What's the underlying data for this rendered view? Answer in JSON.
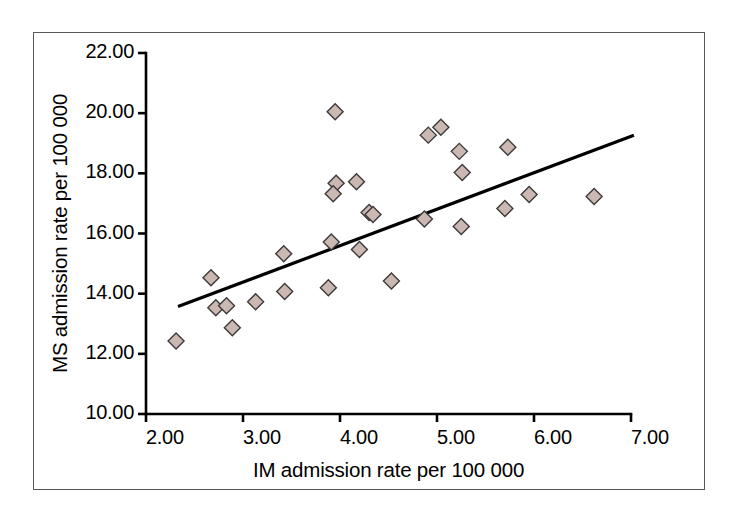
{
  "chart_data": {
    "type": "scatter",
    "title": "",
    "xlabel": "IM admission rate per 100 000",
    "ylabel": "MS admission rate per 100 000",
    "xlim": [
      2.0,
      7.0
    ],
    "ylim": [
      10.0,
      22.0
    ],
    "xticks": [
      "2.00",
      "3.00",
      "4.00",
      "5.00",
      "6.00",
      "7.00"
    ],
    "xtick_values": [
      2.0,
      3.0,
      4.0,
      5.0,
      6.0,
      7.0
    ],
    "yticks": [
      "10.00",
      "12.00",
      "14.00",
      "16.00",
      "18.00",
      "20.00",
      "22.00"
    ],
    "ytick_values": [
      10.0,
      12.0,
      14.0,
      16.0,
      18.0,
      20.0,
      22.0
    ],
    "grid": false,
    "legend": null,
    "marker": {
      "shape": "diamond",
      "fill": "#cbb8b2",
      "stroke": "#3c3a3a",
      "size": 16
    },
    "points": [
      {
        "x": 2.31,
        "y": 12.43
      },
      {
        "x": 2.72,
        "y": 13.53
      },
      {
        "x": 2.67,
        "y": 14.53
      },
      {
        "x": 2.83,
        "y": 13.6
      },
      {
        "x": 2.89,
        "y": 12.87
      },
      {
        "x": 3.13,
        "y": 13.73
      },
      {
        "x": 3.43,
        "y": 14.07
      },
      {
        "x": 3.42,
        "y": 15.33
      },
      {
        "x": 3.88,
        "y": 14.2
      },
      {
        "x": 3.91,
        "y": 15.72
      },
      {
        "x": 3.96,
        "y": 17.67
      },
      {
        "x": 3.93,
        "y": 17.32
      },
      {
        "x": 3.95,
        "y": 20.05
      },
      {
        "x": 4.17,
        "y": 17.72
      },
      {
        "x": 4.2,
        "y": 15.47
      },
      {
        "x": 4.3,
        "y": 16.7
      },
      {
        "x": 4.34,
        "y": 16.63
      },
      {
        "x": 4.53,
        "y": 14.42
      },
      {
        "x": 4.87,
        "y": 16.48
      },
      {
        "x": 4.91,
        "y": 19.27
      },
      {
        "x": 5.04,
        "y": 19.53
      },
      {
        "x": 5.23,
        "y": 18.73
      },
      {
        "x": 5.26,
        "y": 18.03
      },
      {
        "x": 5.25,
        "y": 16.23
      },
      {
        "x": 5.7,
        "y": 16.83
      },
      {
        "x": 5.73,
        "y": 18.87
      },
      {
        "x": 5.95,
        "y": 17.3
      },
      {
        "x": 6.62,
        "y": 17.23
      }
    ],
    "trendline": {
      "type": "linear-fit",
      "x_start": 2.33,
      "y_start": 13.57,
      "x_end": 7.03,
      "y_end": 19.27,
      "color": "#000000",
      "width": 3.2
    }
  },
  "frame": {
    "border_color": "#58585a"
  }
}
